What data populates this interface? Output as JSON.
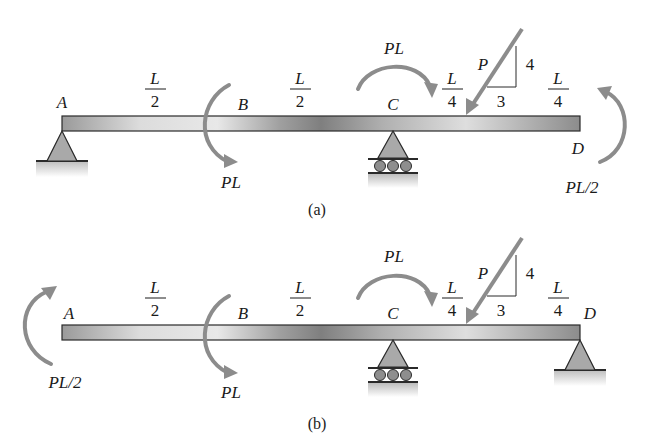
{
  "figure_a": {
    "caption": "(a)",
    "points": {
      "A": "A",
      "B": "B",
      "C": "C",
      "D": "D"
    },
    "spans": [
      {
        "num": "L",
        "den": "2"
      },
      {
        "num": "L",
        "den": "2"
      },
      {
        "num": "L",
        "den": "4"
      },
      {
        "num": "L",
        "den": "4"
      }
    ],
    "moment_B": "PL",
    "moment_C": "PL",
    "moment_D": "PL/2",
    "force": {
      "label": "P",
      "slope_rise": "4",
      "slope_run": "3"
    },
    "supports": {
      "A": "pin",
      "C": "roller"
    }
  },
  "figure_b": {
    "caption": "(b)",
    "points": {
      "A": "A",
      "B": "B",
      "C": "C",
      "D": "D"
    },
    "spans": [
      {
        "num": "L",
        "den": "2"
      },
      {
        "num": "L",
        "den": "2"
      },
      {
        "num": "L",
        "den": "4"
      },
      {
        "num": "L",
        "den": "4"
      }
    ],
    "moment_A": "PL/2",
    "moment_B": "PL",
    "moment_C": "PL",
    "force": {
      "label": "P",
      "slope_rise": "4",
      "slope_run": "3"
    },
    "supports": {
      "C": "roller",
      "D": "pin"
    }
  },
  "colors": {
    "beam_light": "#e4e4e4",
    "beam_dark": "#8a8a8a",
    "arrow": "#8c8c8c",
    "support_fill": "#a9a9a9",
    "outline": "#2a2a2a"
  }
}
